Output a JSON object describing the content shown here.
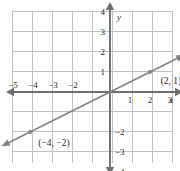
{
  "figure": {
    "kind": "coordinate-plane-line-graph",
    "width": 180,
    "height": 171,
    "background": "#ffffff"
  },
  "colors": {
    "grid": "#b9b9bb",
    "grid_outer": "#c9c9cb",
    "axis": "#6d6e71",
    "line": "#808285",
    "text": "#231f20",
    "point": "#808285"
  },
  "grid": {
    "origin_px": {
      "x": 110,
      "y": 92
    },
    "cell_px": 20,
    "left_px": 12,
    "right_px": 172,
    "top_px": 11,
    "bottom_px": 163
  },
  "axes": {
    "x_label": "x",
    "y_label": "y",
    "x_ticks_negative": [
      "−5",
      "−4",
      "−3",
      "−2"
    ],
    "x_ticks_positive": [
      "1",
      "2",
      "3"
    ],
    "y_ticks_positive": [
      "1",
      "2",
      "3",
      "4"
    ],
    "y_ticks_negative": [
      "−2",
      "−3",
      "−4"
    ],
    "x_range": [
      -5,
      3
    ],
    "y_range": [
      -4,
      4
    ],
    "arrowheads": [
      "left",
      "right",
      "up",
      "down"
    ]
  },
  "chart_data": {
    "type": "line",
    "title": "",
    "xlabel": "x",
    "ylabel": "y",
    "xlim": [
      -5,
      3.5
    ],
    "ylim": [
      -4.5,
      4.5
    ],
    "grid": true,
    "legend": null,
    "series": [
      {
        "name": "line",
        "slope": 0.5,
        "intercept": 0,
        "equation": "y = 0.5x",
        "x": [
          -4,
          2
        ],
        "values": [
          -2,
          1
        ],
        "extends_both_directions": true
      }
    ],
    "points": [
      {
        "x": -4,
        "y": -2,
        "label": "(−4, −2)",
        "label_position": "below-right"
      },
      {
        "x": 2,
        "y": 1,
        "label": "(2, 1)",
        "label_position": "below-right"
      }
    ]
  },
  "annotations": {
    "point_label_1": "(−4, −2)",
    "point_label_2": "(2, 1)"
  }
}
